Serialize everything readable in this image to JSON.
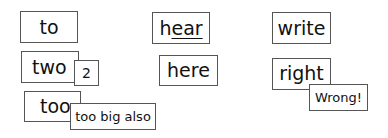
{
  "cards": {
    "to": "to",
    "two": "two",
    "two_note": "2",
    "too": "too",
    "too_note": "too big also",
    "hear_prefix": "h",
    "hear_underlined": "ear",
    "here": "here",
    "write": "write",
    "right": "right",
    "right_note": "Wrong!"
  }
}
